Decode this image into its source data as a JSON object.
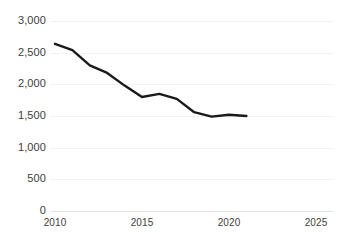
{
  "chart_data": {
    "type": "line",
    "title": "",
    "subtitle": "",
    "xlabel": "",
    "ylabel": "",
    "x": [
      2010,
      2011,
      2012,
      2013,
      2014,
      2015,
      2016,
      2017,
      2018,
      2019,
      2020,
      2021
    ],
    "series": [
      {
        "name": "",
        "values": [
          2640,
          2540,
          2300,
          2180,
          1980,
          1800,
          1850,
          1770,
          1560,
          1490,
          1520,
          1500
        ]
      }
    ],
    "xlim": [
      2010,
      2025
    ],
    "ylim": [
      0,
      3000
    ],
    "xticks": [
      2010,
      2015,
      2020,
      2025
    ],
    "xtick_labels": [
      "2010",
      "2015",
      "2020",
      "2025"
    ],
    "yticks": [
      0,
      500,
      1000,
      1500,
      2000,
      2500,
      3000
    ],
    "ytick_labels": [
      "0",
      "500",
      "1,000",
      "1,500",
      "2,000",
      "2,500",
      "3,000"
    ],
    "grid": true,
    "grid_axis": "y",
    "legend": false,
    "legend_position": "none",
    "annotations": [],
    "colors": {
      "line": "#1a1a1a",
      "grid": "#f2f2f2",
      "axis": "#e3e3e3",
      "tick_text": "#404040",
      "background": "#ffffff"
    }
  },
  "axes": {
    "y_labels": [
      {
        "text": "3,000",
        "value": 3000
      },
      {
        "text": "2,500",
        "value": 2500
      },
      {
        "text": "2,000",
        "value": 2000
      },
      {
        "text": "1,500",
        "value": 1500
      },
      {
        "text": "1,000",
        "value": 1000
      },
      {
        "text": "500",
        "value": 500
      },
      {
        "text": "0",
        "value": 0
      }
    ],
    "x_labels": [
      {
        "text": "2010",
        "value": 2010
      },
      {
        "text": "2015",
        "value": 2015
      },
      {
        "text": "2020",
        "value": 2020
      },
      {
        "text": "2025",
        "value": 2025
      }
    ]
  },
  "top_clipped_text": ""
}
